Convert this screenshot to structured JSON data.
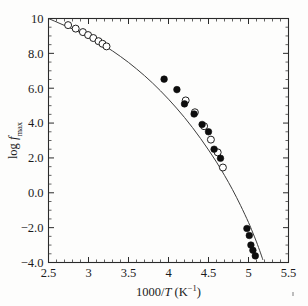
{
  "figure": {
    "background_color": "#fdfdfc",
    "ink_color": "#1b1b1b",
    "speck_label": "scan-artifact"
  },
  "chart_data": {
    "type": "scatter",
    "title": "",
    "subtitle": "",
    "xlabel": "1000/T (K⁻¹)",
    "ylabel": "log f max",
    "xlabel_parts": {
      "prefix": "1000/",
      "italic": "T",
      "suffix_open": " (K",
      "superscript": "−1",
      "suffix_close": ")"
    },
    "ylabel_parts": {
      "prefix": "log ",
      "italic": "f",
      "subscript": "max"
    },
    "xlim": [
      2.5,
      5.5
    ],
    "ylim": [
      -4.0,
      10.0
    ],
    "xticks": [
      2.5,
      3.0,
      3.5,
      4.0,
      4.5,
      5.0,
      5.5
    ],
    "xticklabels": [
      "2.5",
      "3",
      "3.5",
      "4",
      "4.5",
      "5",
      "5.5"
    ],
    "yticks": [
      -4.0,
      -2.0,
      0.0,
      2.0,
      4.0,
      6.0,
      8.0,
      10.0
    ],
    "yticklabels": [
      "−4.0",
      "−2.0",
      "0.0",
      "2.0",
      "4.0",
      "6.0",
      "8.0",
      "10"
    ],
    "x_minor_per_major": 5,
    "y_minor_per_major": 4,
    "grid": false,
    "legend": null,
    "legend_position": "none",
    "tick_direction": "in",
    "frame": "box-all-four-sides",
    "series": [
      {
        "name": "open circles",
        "marker": "open-circle",
        "marker_color": "#ffffff",
        "marker_edge_color": "#1f1f1f",
        "points": [
          [
            2.745,
            9.62
          ],
          [
            2.84,
            9.42
          ],
          [
            2.93,
            9.22
          ],
          [
            2.995,
            9.05
          ],
          [
            3.06,
            8.88
          ],
          [
            3.125,
            8.7
          ],
          [
            3.175,
            8.55
          ],
          [
            3.225,
            8.4
          ],
          [
            4.215,
            5.3
          ],
          [
            4.33,
            4.62
          ],
          [
            4.445,
            3.82
          ],
          [
            4.53,
            3.05
          ],
          [
            4.615,
            2.32
          ],
          [
            4.68,
            1.45
          ]
        ]
      },
      {
        "name": "filled circles",
        "marker": "filled-circle",
        "marker_color": "#0d0d0d",
        "marker_edge_color": "#0d0d0d",
        "points": [
          [
            3.945,
            6.52
          ],
          [
            4.105,
            5.92
          ],
          [
            4.2,
            5.1
          ],
          [
            4.32,
            4.52
          ],
          [
            4.42,
            3.92
          ],
          [
            4.5,
            3.5
          ],
          [
            4.57,
            2.5
          ],
          [
            4.65,
            1.98
          ],
          [
            4.98,
            -2.05
          ],
          [
            5.01,
            -2.45
          ],
          [
            5.03,
            -3.0
          ],
          [
            5.055,
            -3.3
          ],
          [
            5.085,
            -3.62
          ]
        ]
      }
    ],
    "fit_curve": {
      "name": "VFT fit",
      "style": "solid",
      "color": "#3d3d3d",
      "points": [
        [
          2.5,
          10.0
        ],
        [
          2.6,
          9.8
        ],
        [
          2.7,
          9.6
        ],
        [
          2.8,
          9.4
        ],
        [
          2.9,
          9.18
        ],
        [
          3.0,
          8.95
        ],
        [
          3.1,
          8.7
        ],
        [
          3.2,
          8.43
        ],
        [
          3.3,
          8.14
        ],
        [
          3.4,
          7.82
        ],
        [
          3.5,
          7.48
        ],
        [
          3.6,
          7.11
        ],
        [
          3.7,
          6.72
        ],
        [
          3.8,
          6.3
        ],
        [
          3.9,
          5.85
        ],
        [
          4.0,
          5.37
        ],
        [
          4.1,
          4.86
        ],
        [
          4.2,
          4.32
        ],
        [
          4.3,
          3.74
        ],
        [
          4.4,
          3.12
        ],
        [
          4.5,
          2.46
        ],
        [
          4.6,
          1.76
        ],
        [
          4.7,
          1.0
        ],
        [
          4.8,
          0.18
        ],
        [
          4.9,
          -0.72
        ],
        [
          5.0,
          -1.7
        ],
        [
          5.05,
          -2.25
        ],
        [
          5.1,
          -2.82
        ],
        [
          5.15,
          -3.45
        ],
        [
          5.18,
          -3.85
        ]
      ]
    }
  }
}
